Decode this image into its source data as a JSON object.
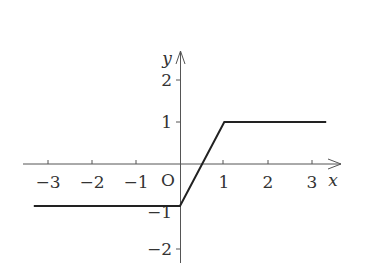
{
  "chart_data": {
    "type": "line",
    "title": "",
    "xlabel": "x",
    "ylabel": "y",
    "origin_label": "O",
    "xlim": [
      -3.3,
      3.3
    ],
    "ylim": [
      -2.3,
      2.6
    ],
    "grid": false,
    "legend": null,
    "x_ticks": [
      "-3",
      "-2",
      "-1",
      "1",
      "2",
      "3"
    ],
    "y_ticks": [
      "2",
      "1",
      "-1",
      "-2"
    ],
    "series": [
      {
        "name": "f(x)",
        "description": "y = -1 for x <= 0; y = 2x - 1 for 0 <= x <= 1; y = 1 for x >= 1",
        "points": [
          [
            -3.3,
            -1
          ],
          [
            0,
            -1
          ],
          [
            1,
            1
          ],
          [
            3.3,
            1
          ]
        ],
        "color": "#222222"
      }
    ]
  },
  "labels": {
    "x_axis": "x",
    "y_axis": "y",
    "origin": "O",
    "xt_m3": "−3",
    "xt_m2": "−2",
    "xt_m1": "−1",
    "xt_1": "1",
    "xt_2": "2",
    "xt_3": "3",
    "yt_2": "2",
    "yt_1": "1",
    "yt_m1": "−1",
    "yt_m2": "−2"
  }
}
